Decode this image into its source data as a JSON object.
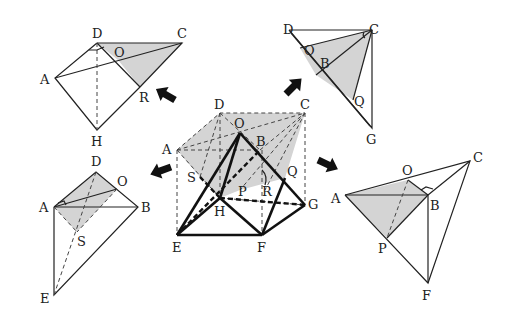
{
  "figure": {
    "shade_color": "#d4d4d4",
    "line_color": "#222222",
    "center": {
      "labels": {
        "A": "A",
        "B": "B",
        "C": "C",
        "D": "D",
        "O": "O",
        "E": "E",
        "F": "F",
        "G": "G",
        "H": "H",
        "P": "P",
        "Q": "Q",
        "R": "R",
        "S": "S"
      }
    },
    "top_left": {
      "labels": {
        "A": "A",
        "C": "C",
        "D": "D",
        "O": "O",
        "R": "R",
        "H": "H"
      }
    },
    "top_right": {
      "labels": {
        "D": "D",
        "C": "C",
        "O": "O",
        "B": "B",
        "Q": "Q",
        "G": "G"
      }
    },
    "bottom_left": {
      "labels": {
        "D": "D",
        "O": "O",
        "A": "A",
        "B": "B",
        "S": "S",
        "E": "E"
      }
    },
    "bottom_right": {
      "labels": {
        "C": "C",
        "O": "O",
        "A": "A",
        "B": "B",
        "P": "P",
        "F": "F"
      }
    },
    "arrows": [
      {
        "direction": "up-left",
        "target": "top_left"
      },
      {
        "direction": "up-right",
        "target": "top_right"
      },
      {
        "direction": "down-left",
        "target": "bottom_left"
      },
      {
        "direction": "down-right",
        "target": "bottom_right"
      }
    ]
  }
}
